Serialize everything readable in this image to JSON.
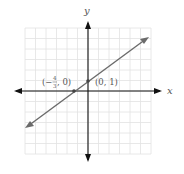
{
  "chart_data": {
    "type": "line",
    "title": "",
    "xlabel": "x",
    "ylabel": "y",
    "xlim": [
      -6,
      6
    ],
    "ylim": [
      -6,
      6
    ],
    "grid": true,
    "series": [
      {
        "name": "y = (3/4)x + 1",
        "slope": 0.75,
        "intercept": 1,
        "x": [
          -5.5,
          5.5
        ],
        "y": [
          -3.125,
          5.125
        ]
      }
    ],
    "points": [
      {
        "x": -1.3333,
        "y": 0,
        "label": "(−4/3, 0)"
      },
      {
        "x": 0,
        "y": 1,
        "label": "(0, 1)"
      }
    ]
  },
  "labels": {
    "x_axis": "x",
    "y_axis": "y",
    "point_a_prefix": "(−",
    "point_a_num": "4",
    "point_a_den": "3",
    "point_a_suffix": ", 0)",
    "point_b": "(0, 1)"
  },
  "colors": {
    "axis": "#111111",
    "line": "#6b6b6b",
    "grid": "#e2e2e2",
    "label": "#555555"
  }
}
